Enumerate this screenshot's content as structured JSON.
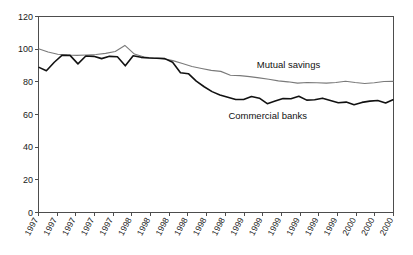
{
  "chart_data": {
    "type": "line",
    "title": "",
    "subtitle": "",
    "xlabel": "",
    "ylabel": "",
    "ylim": [
      0,
      120
    ],
    "ytick_values": [
      0,
      20,
      40,
      60,
      80,
      100,
      120
    ],
    "ytick_labels": [
      "0",
      "20",
      "40",
      "60",
      "80",
      "100",
      "120"
    ],
    "grid": false,
    "legend_position": "inline-annotation",
    "categories": [
      "1997",
      "1997",
      "1997",
      "1997",
      "1997",
      "1998",
      "1998",
      "1998",
      "1998",
      "1998",
      "1998",
      "1999",
      "1999",
      "1999",
      "1999",
      "1999",
      "1999",
      "2000",
      "2000",
      "2000"
    ],
    "x": [
      0,
      1,
      2,
      3,
      4,
      5,
      6,
      7,
      8,
      9,
      10,
      11,
      12,
      13,
      14,
      15,
      16,
      17,
      18,
      19
    ],
    "series": [
      {
        "name": "Mutual savings",
        "color": "#7a7a7a",
        "line_width": 1.1,
        "values": [
          100.2,
          98.5,
          96.8,
          96.3,
          96.2,
          96.5,
          97.0,
          98.2,
          102.5,
          96.0,
          94.8,
          94.0,
          92.8,
          90.5,
          88.0,
          86.5,
          84.0,
          83.5,
          82.5,
          81.5
        ]
      },
      {
        "name": "Commercial banks",
        "color": "#111111",
        "line_width": 1.6,
        "values": [
          89.0,
          86.8,
          96.3,
          96.2,
          91.0,
          95.8,
          95.0,
          94.5,
          95.5,
          89.8,
          96.0,
          95.0,
          94.5,
          94.5,
          94.2,
          92.0,
          85.5,
          85.0,
          80.0,
          74.0
        ]
      }
    ],
    "annotations": [
      {
        "text": "Mutual savings",
        "x_frac": 0.615,
        "y_value": 88.5
      },
      {
        "text": "Commercial banks",
        "x_frac": 0.535,
        "y_value": 57.5
      }
    ],
    "series_full": {
      "mutual_savings": [
        100.2,
        98.3,
        96.9,
        96.4,
        96.2,
        96.4,
        96.7,
        97.4,
        98.6,
        102.3,
        97.0,
        95.2,
        94.6,
        94.2,
        93.0,
        91.2,
        89.4,
        88.2,
        87.0,
        86.4,
        84.0,
        83.8,
        83.2,
        82.4,
        81.6,
        80.6,
        80.0,
        79.2,
        79.6,
        79.4,
        79.2,
        79.6,
        80.4,
        79.6,
        79.0,
        79.4,
        80.2,
        80.3
      ],
      "commercial_banks": [
        89.0,
        86.8,
        92.0,
        96.3,
        96.2,
        91.0,
        95.8,
        95.6,
        94.2,
        95.6,
        95.4,
        89.8,
        96.0,
        95.0,
        94.6,
        94.4,
        94.2,
        92.0,
        85.6,
        85.0,
        80.4,
        77.0,
        74.0,
        72.0,
        70.6,
        69.2,
        69.2,
        71.0,
        70.0,
        66.6,
        68.2,
        69.8,
        69.6,
        71.2,
        68.8,
        69.0,
        70.0,
        68.6,
        67.2,
        67.6,
        66.0,
        67.4,
        68.2,
        68.6,
        67.0,
        69.2
      ]
    }
  },
  "axes": {
    "y_axis_name": "y-axis",
    "x_axis_name": "x-axis"
  }
}
